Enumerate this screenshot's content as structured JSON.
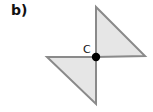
{
  "part_label": "b)",
  "figure": {
    "center_label": "C",
    "fill_color": "#e6e6e6",
    "stroke_color": "#8a8a8a",
    "dot_color": "#000000",
    "triangles": [
      {
        "name": "upper-right-triangle",
        "points": "96,7 96,57 145,56"
      },
      {
        "name": "lower-left-triangle",
        "points": "47,57 96,57 96,104"
      }
    ]
  }
}
